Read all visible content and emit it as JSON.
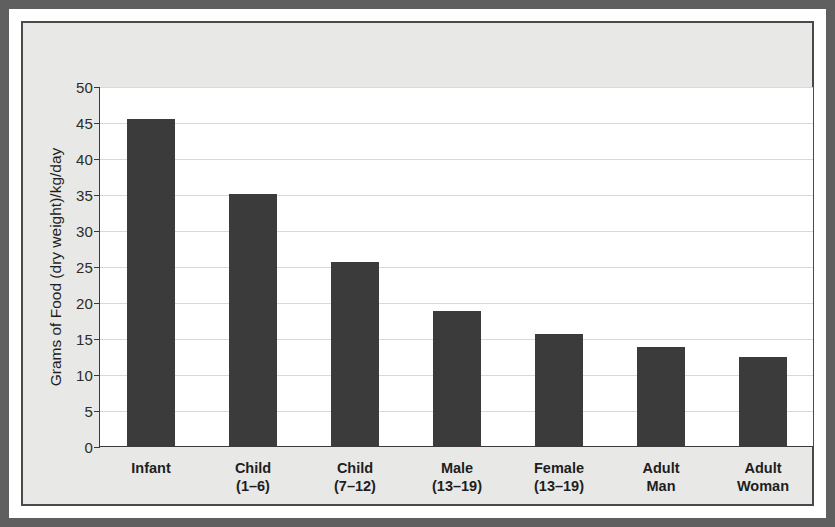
{
  "chart_data": {
    "type": "bar",
    "title": "",
    "xlabel": "",
    "ylabel": "Grams of Food (dry weight)/kg/day",
    "ylim": [
      0,
      50
    ],
    "yticks": [
      0,
      5,
      10,
      15,
      20,
      25,
      30,
      35,
      40,
      45,
      50
    ],
    "ytick_labels": [
      "0",
      "5",
      "10",
      "15",
      "20",
      "25",
      "30",
      "35",
      "40",
      "45",
      "50"
    ],
    "grid": true,
    "legend": "none",
    "bar_color": "#3b3b3b",
    "categories": [
      "Infant",
      "Child\n(1–6)",
      "Child\n(7–12)",
      "Male\n(13–19)",
      "Female\n(13–19)",
      "Adult\nMan",
      "Adult\nWoman"
    ],
    "values": [
      45.4,
      35.0,
      25.5,
      18.7,
      15.5,
      13.8,
      12.3
    ]
  },
  "figure": {
    "background_color": "#e8e8e6",
    "frame_color": "#5f5f5f",
    "plot_background": "#ffffff",
    "gridline_color": "#d9d9d9",
    "axis_color": "#3a3a3a"
  }
}
